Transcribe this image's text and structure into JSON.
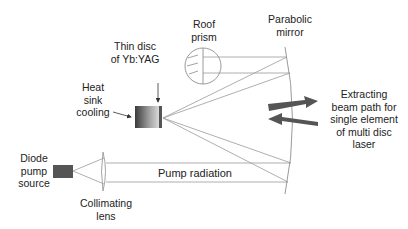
{
  "labels": {
    "roof_prism": "Roof\nprism",
    "parabolic_mirror": "Parabolic\nmirror",
    "thin_disc": "Thin disc\nof Yb:YAG",
    "heat_sink": "Heat\nsink\ncooling",
    "extracting": "Extracting\nbeam path for\nsingle element\nof multi disc\nlaser",
    "diode": "Diode\npump\nsource",
    "pump_radiation": "Pump radiation",
    "collimating_lens": "Collimating\nlens"
  },
  "colors": {
    "line": "#9a9a9a",
    "arrow": "#555555",
    "text": "#222222",
    "diode": "#555555"
  }
}
